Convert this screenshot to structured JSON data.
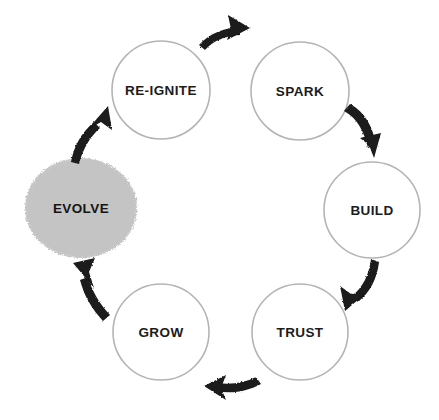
{
  "diagram": {
    "type": "cycle",
    "title": "",
    "background_color": "#ffffff",
    "circle_stroke_color": "#b4b4b4",
    "circle_fill_color": "#ffffff",
    "highlight_fill_color": "#c4c4c4",
    "arrow_color": "#1a1a1a",
    "label_color": "#1c1c1c",
    "nodes": [
      {
        "id": "re-ignite",
        "label": "RE-IGNITE",
        "shape": "circle",
        "highlighted": false,
        "cx": 161,
        "cy": 90,
        "r": 49
      },
      {
        "id": "spark",
        "label": "SPARK",
        "shape": "circle",
        "highlighted": false,
        "cx": 300,
        "cy": 91,
        "r": 49
      },
      {
        "id": "build",
        "label": "BUILD",
        "shape": "circle",
        "highlighted": false,
        "cx": 372,
        "cy": 210,
        "r": 48
      },
      {
        "id": "trust",
        "label": "TRUST",
        "shape": "circle",
        "highlighted": false,
        "cx": 300,
        "cy": 332,
        "r": 48
      },
      {
        "id": "grow",
        "label": "GROW",
        "shape": "circle",
        "highlighted": false,
        "cx": 161,
        "cy": 332,
        "r": 48
      },
      {
        "id": "evolve",
        "label": "EVOLVE",
        "shape": "blob",
        "highlighted": true,
        "cx": 81,
        "cy": 208,
        "r": 57
      }
    ],
    "arrows": [
      {
        "id": "arrow-reignite-to-spark",
        "from": "re-ignite",
        "to": "spark",
        "direction": "right"
      },
      {
        "id": "arrow-spark-to-build",
        "from": "spark",
        "to": "build",
        "direction": "down-right"
      },
      {
        "id": "arrow-build-to-trust",
        "from": "build",
        "to": "trust",
        "direction": "down-left"
      },
      {
        "id": "arrow-trust-to-grow",
        "from": "trust",
        "to": "grow",
        "direction": "left"
      },
      {
        "id": "arrow-grow-to-evolve",
        "from": "grow",
        "to": "evolve",
        "direction": "up-left"
      },
      {
        "id": "arrow-evolve-to-reignite",
        "from": "evolve",
        "to": "re-ignite",
        "direction": "up-right"
      }
    ]
  }
}
